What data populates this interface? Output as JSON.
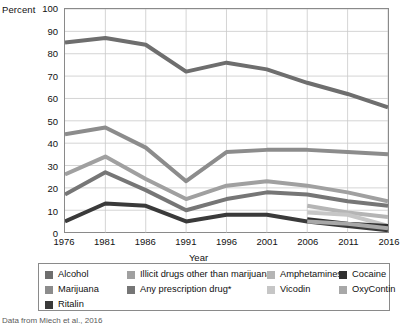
{
  "chart_data": {
    "type": "line",
    "title": "",
    "xlabel": "Year",
    "ylabel": "Percent",
    "xlim": [
      1976,
      2016
    ],
    "ylim": [
      0,
      100
    ],
    "ytick_step": 10,
    "grid": true,
    "legend_position": "bottom",
    "x": [
      1976,
      1981,
      1986,
      1991,
      1996,
      2001,
      2006,
      2011,
      2016
    ],
    "xticks": [
      "1976",
      "1981",
      "1986",
      "1991",
      "1996",
      "2001",
      "2006",
      "2011",
      "2016"
    ],
    "yticks": [
      "0",
      "10",
      "20",
      "30",
      "40",
      "50",
      "60",
      "70",
      "80",
      "90",
      "100"
    ],
    "series": [
      {
        "name": "Alcohol",
        "color": "#6e6e6e",
        "x": [
          1976,
          1981,
          1986,
          1991,
          1996,
          2001,
          2006,
          2011,
          2016
        ],
        "values": [
          85,
          87,
          84,
          72,
          76,
          73,
          67,
          62,
          56
        ]
      },
      {
        "name": "Marijuana",
        "color": "#8c8c8c",
        "x": [
          1976,
          1981,
          1986,
          1991,
          1996,
          2001,
          2006,
          2011,
          2016
        ],
        "values": [
          44,
          47,
          38,
          23,
          36,
          37,
          37,
          36,
          35
        ]
      },
      {
        "name": "Illicit drugs other than marijuana",
        "color": "#a0a0a0",
        "x": [
          1976,
          1981,
          1986,
          1991,
          1996,
          2001,
          2006,
          2011,
          2016
        ],
        "values": [
          26,
          34,
          24,
          15,
          21,
          23,
          21,
          18,
          14
        ]
      },
      {
        "name": "Any prescription drug*",
        "color": "#767676",
        "x": [
          1976,
          1981,
          1986,
          1991,
          1996,
          2001,
          2006,
          2011,
          2016
        ],
        "values": [
          17,
          27,
          19,
          10,
          15,
          18,
          17,
          14,
          12
        ]
      },
      {
        "name": "Ritalin",
        "color": "#3a3a3a",
        "x": [
          1976,
          1981,
          1986,
          1991,
          1996,
          2001,
          2006,
          2011,
          2016
        ],
        "values": [
          5,
          13,
          12,
          5,
          8,
          8,
          5,
          3,
          1
        ]
      },
      {
        "name": "Amphetamines",
        "color": "#b5b5b5",
        "x": [
          2006,
          2011,
          2016
        ],
        "values": [
          12,
          9,
          7
        ]
      },
      {
        "name": "Vicodin",
        "color": "#c6c6c6",
        "x": [
          2006,
          2011,
          2016
        ],
        "values": [
          9,
          8,
          3
        ]
      },
      {
        "name": "Cocaine",
        "color": "#303030",
        "x": [
          2006,
          2011,
          2016
        ],
        "values": [
          6,
          4,
          3
        ]
      },
      {
        "name": "OxyContin",
        "color": "#a8a8a8",
        "x": [
          2006,
          2011,
          2016
        ],
        "values": [
          5,
          4,
          2
        ]
      }
    ]
  },
  "legend": {
    "columns": [
      {
        "items": [
          "Alcohol",
          "Marijuana",
          "Ritalin"
        ]
      },
      {
        "items": [
          "Illicit drugs other than marijuana",
          "Any prescription drug*"
        ]
      },
      {
        "items": [
          "Amphetamines",
          "Vicodin"
        ]
      },
      {
        "items": [
          "Cocaine",
          "OxyContin"
        ]
      }
    ]
  },
  "footnote": "Data from Miech et al., 2016"
}
